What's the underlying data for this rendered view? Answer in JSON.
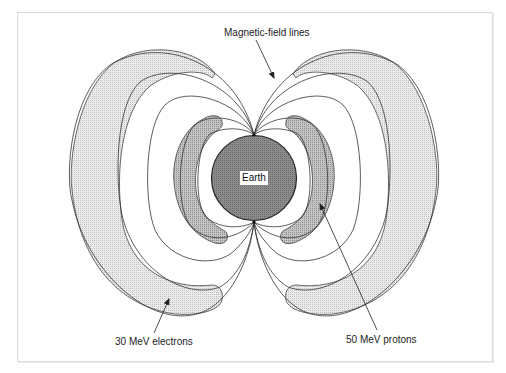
{
  "diagram": {
    "labels": {
      "magnetic_field_lines": "Magnetic-field lines",
      "earth": "Earth",
      "electrons": "30 MeV electrons",
      "protons": "50 MeV protons"
    },
    "regions": [
      {
        "name": "outer-belt",
        "label": "30 MeV electrons",
        "fill": "#e4e4e4"
      },
      {
        "name": "inner-belt",
        "label": "50 MeV protons",
        "fill": "#bdbdbd"
      },
      {
        "name": "earth",
        "label": "Earth",
        "fill": "#8a8a8a"
      }
    ],
    "colors": {
      "line": "#333333",
      "frame": "#dcdcdc",
      "background": "#ffffff"
    }
  }
}
